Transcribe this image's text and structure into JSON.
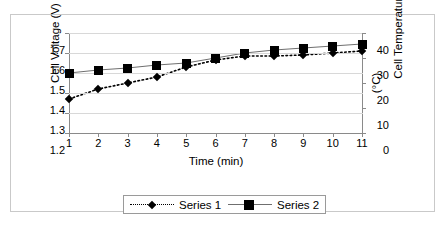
{
  "chart_data": {
    "type": "line",
    "title": "",
    "xlabel": "Time (min)",
    "ylabel": "Cell Voltage (V)",
    "y2label": "Cell Temperature (°C)",
    "y2label_unit": "(°C)",
    "x": [
      1,
      2,
      3,
      4,
      5,
      6,
      7,
      8,
      9,
      10,
      11
    ],
    "xticklabels": [
      "1",
      "2",
      "3",
      "4",
      "5",
      "6",
      "7",
      "8",
      "9",
      "10",
      "11"
    ],
    "yticklabels": [
      "1.7",
      "1.6",
      "1.5",
      "1.4",
      "1.3",
      "1.2"
    ],
    "yticks": [
      1.7,
      1.6,
      1.5,
      1.4,
      1.3,
      1.2
    ],
    "ylim": [
      1.2,
      1.7
    ],
    "y2ticklabels": [
      "40",
      "30",
      "20",
      "10",
      "0"
    ],
    "y2ticks": [
      40,
      30,
      20,
      10,
      0
    ],
    "y2lim": [
      0,
      40
    ],
    "grid": true,
    "legend_position": "bottom",
    "series": [
      {
        "name": "Series 1",
        "axis": "left",
        "marker": "diamond",
        "linestyle": "dotted",
        "color": "#000000",
        "values": [
          1.37,
          1.42,
          1.45,
          1.48,
          1.53,
          1.565,
          1.585,
          1.585,
          1.59,
          1.6,
          1.61
        ]
      },
      {
        "name": "Series 2",
        "axis": "left",
        "marker": "square",
        "linestyle": "solid",
        "color": "#000000",
        "values": [
          1.5,
          1.515,
          1.525,
          1.54,
          1.55,
          1.575,
          1.6,
          1.615,
          1.625,
          1.635,
          1.645
        ]
      }
    ]
  },
  "legend": {
    "entries": [
      {
        "label": "Series 1"
      },
      {
        "label": "Series 2"
      }
    ]
  },
  "artifact": {
    "top_text": ""
  },
  "colors": {
    "frame": "#c9c9c9",
    "axis": "#8a8a8a",
    "grid": "#d8d8d8",
    "marker": "#000000",
    "series2_line": "#6f6f6f"
  }
}
